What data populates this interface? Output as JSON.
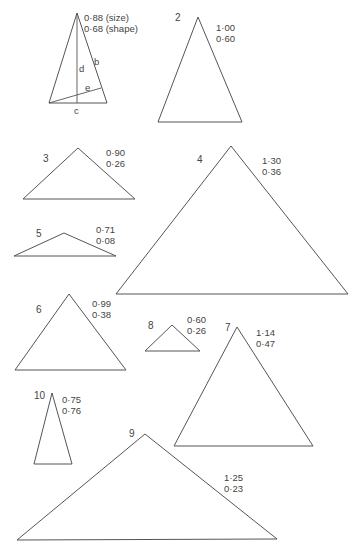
{
  "figure": {
    "triangles": [
      {
        "id": "1",
        "number_label": "",
        "size": "0·88 (size)",
        "shape": "0·68 (shape)",
        "points": "77,13 49,103 107,103",
        "label_pos": [
          0,
          0
        ],
        "vals_pos": [
          84,
          12
        ]
      },
      {
        "id": "2",
        "number_label": "2",
        "size": "1·00",
        "shape": "0·60",
        "points": "198,17 158,122 242,122",
        "label_pos": [
          175,
          13
        ],
        "vals_pos": [
          216,
          22
        ]
      },
      {
        "id": "3",
        "number_label": "3",
        "size": "0·90",
        "shape": "0·26",
        "points": "78,148 23,199 135,199",
        "label_pos": [
          43,
          153
        ],
        "vals_pos": [
          106,
          147
        ]
      },
      {
        "id": "4",
        "number_label": "4",
        "size": "1·30",
        "shape": "0·36",
        "points": "231,146 116,294 348,294",
        "label_pos": [
          197,
          154
        ],
        "vals_pos": [
          260,
          154
        ]
      },
      {
        "id": "5",
        "number_label": "5",
        "size": "0·71",
        "shape": "0·08",
        "points": "64,233 14,256 116,256",
        "label_pos": [
          36,
          229
        ],
        "vals_pos": [
          96,
          225
        ]
      },
      {
        "id": "6",
        "number_label": "6",
        "size": "0·99",
        "shape": "0·38",
        "points": "69,294 15,370 126,370",
        "label_pos": [
          36,
          305
        ],
        "vals_pos": [
          92,
          298
        ]
      },
      {
        "id": "7",
        "number_label": "7",
        "size": "1·14",
        "shape": "0·47",
        "points": "237,327 174,446 313,446",
        "label_pos": [
          225,
          323
        ],
        "vals_pos": [
          256,
          327
        ]
      },
      {
        "id": "8",
        "number_label": "8",
        "size": "0·60",
        "shape": "0·26",
        "points": "172,325 145,351 200,351",
        "label_pos": [
          148,
          321
        ],
        "vals_pos": [
          187,
          315
        ]
      },
      {
        "id": "9",
        "number_label": "9",
        "size": "1·25",
        "shape": "0·23",
        "points": "145,434 17,540 277,539",
        "label_pos": [
          129,
          428
        ],
        "vals_pos": [
          224,
          471
        ]
      },
      {
        "id": "10",
        "number_label": "10",
        "size": "0·75",
        "shape": "0·76",
        "points": "52,393 34,464 72,464",
        "label_pos": [
          34,
          390
        ],
        "vals_pos": [
          62,
          394
        ]
      }
    ],
    "reference_letters": {
      "b": "b",
      "c": "c",
      "d": "d",
      "e": "e"
    },
    "stroke_color": "#555555",
    "text_color": "#444444",
    "background": "#ffffff"
  }
}
